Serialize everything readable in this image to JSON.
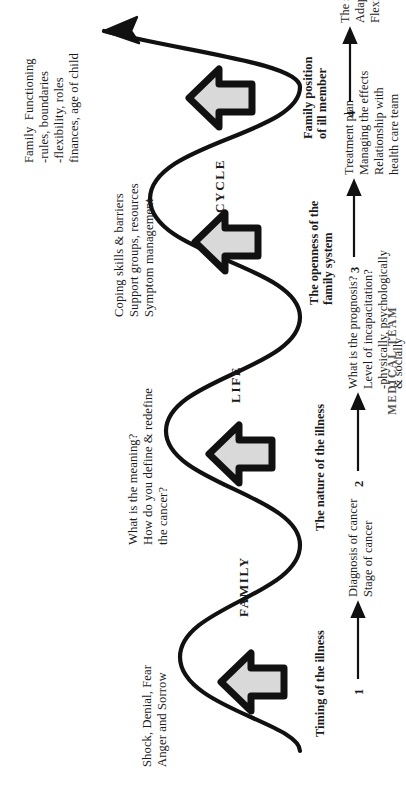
{
  "figure": {
    "title_words": [
      "FAMILY",
      "LIFE",
      "CYCLE"
    ],
    "caption": "MEDICAL TEAM",
    "wave_arrow_icon": "curved-arrow-icon"
  },
  "stages": [
    {
      "number": "1",
      "stage_label": "Timing of the illness",
      "family_response": "Shock, Denial, Fear\nAnger and Sorrow",
      "medical_note": "Diagnosis of cancer\nStage of cancer"
    },
    {
      "number": "2",
      "stage_label": "The nature of the illness",
      "family_response": "What is the meaning?\nHow do you define & redefine\nthe cancer?",
      "medical_note": "What is the prognosis?\nLevel of incapacitation?\n-physically, psychologically\n& socially"
    },
    {
      "number": "3",
      "stage_label": "The openness of the\nfamily system",
      "family_response": "Coping skills & barriers\nSupport groups, resources\nSymptom management",
      "medical_note": "Treatment plan\nManaging the effects\nRelationship with\nhealth care team"
    },
    {
      "number": "4",
      "stage_label": "Family position\nof ill member",
      "family_response": "Family  Functioning\n-rules, boundaries\n-flexibility, roles\nfinances, age of child",
      "medical_note": "The state of the family\nAdaptation to illness\nFlexibility"
    }
  ],
  "colors": {
    "ink": "#1a1a1a",
    "arrow_fill": "#d9d9d9",
    "arrow_outline": "#111111",
    "page": "#ffffff"
  }
}
